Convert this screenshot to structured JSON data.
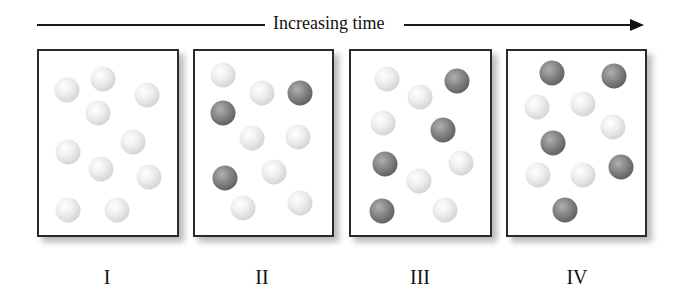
{
  "header": {
    "title": "Increasing time"
  },
  "colors": {
    "light_ball": "#e0e0e0",
    "dark_ball": "#707070",
    "border": "#2a2a2a"
  },
  "panels": [
    {
      "label": "I",
      "dark_count": 0,
      "balls": [
        {
          "x": 67,
          "y": 90,
          "type": "light"
        },
        {
          "x": 103,
          "y": 79,
          "type": "light"
        },
        {
          "x": 147,
          "y": 95,
          "type": "light"
        },
        {
          "x": 98,
          "y": 113,
          "type": "light"
        },
        {
          "x": 133,
          "y": 142,
          "type": "light"
        },
        {
          "x": 68,
          "y": 152,
          "type": "light"
        },
        {
          "x": 101,
          "y": 169,
          "type": "light"
        },
        {
          "x": 149,
          "y": 177,
          "type": "light"
        },
        {
          "x": 68,
          "y": 210,
          "type": "light"
        },
        {
          "x": 117,
          "y": 210,
          "type": "light"
        }
      ]
    },
    {
      "label": "II",
      "dark_count": 3,
      "balls": [
        {
          "x": 223,
          "y": 75,
          "type": "light"
        },
        {
          "x": 262,
          "y": 93,
          "type": "light"
        },
        {
          "x": 300,
          "y": 93,
          "type": "dark"
        },
        {
          "x": 223,
          "y": 113,
          "type": "dark"
        },
        {
          "x": 252,
          "y": 138,
          "type": "light"
        },
        {
          "x": 298,
          "y": 137,
          "type": "light"
        },
        {
          "x": 225,
          "y": 178,
          "type": "dark"
        },
        {
          "x": 274,
          "y": 172,
          "type": "light"
        },
        {
          "x": 243,
          "y": 208,
          "type": "light"
        },
        {
          "x": 300,
          "y": 203,
          "type": "light"
        }
      ]
    },
    {
      "label": "III",
      "dark_count": 4,
      "balls": [
        {
          "x": 387,
          "y": 79,
          "type": "light"
        },
        {
          "x": 457,
          "y": 81,
          "type": "dark"
        },
        {
          "x": 420,
          "y": 97,
          "type": "light"
        },
        {
          "x": 383,
          "y": 123,
          "type": "light"
        },
        {
          "x": 443,
          "y": 130,
          "type": "dark"
        },
        {
          "x": 385,
          "y": 164,
          "type": "dark"
        },
        {
          "x": 461,
          "y": 163,
          "type": "light"
        },
        {
          "x": 419,
          "y": 181,
          "type": "light"
        },
        {
          "x": 382,
          "y": 211,
          "type": "dark"
        },
        {
          "x": 445,
          "y": 210,
          "type": "light"
        }
      ]
    },
    {
      "label": "IV",
      "dark_count": 5,
      "balls": [
        {
          "x": 552,
          "y": 73,
          "type": "dark"
        },
        {
          "x": 614,
          "y": 76,
          "type": "dark"
        },
        {
          "x": 537,
          "y": 107,
          "type": "light"
        },
        {
          "x": 583,
          "y": 104,
          "type": "light"
        },
        {
          "x": 613,
          "y": 127,
          "type": "light"
        },
        {
          "x": 553,
          "y": 143,
          "type": "dark"
        },
        {
          "x": 621,
          "y": 167,
          "type": "dark"
        },
        {
          "x": 538,
          "y": 175,
          "type": "light"
        },
        {
          "x": 583,
          "y": 175,
          "type": "light"
        },
        {
          "x": 565,
          "y": 210,
          "type": "dark"
        }
      ]
    }
  ]
}
